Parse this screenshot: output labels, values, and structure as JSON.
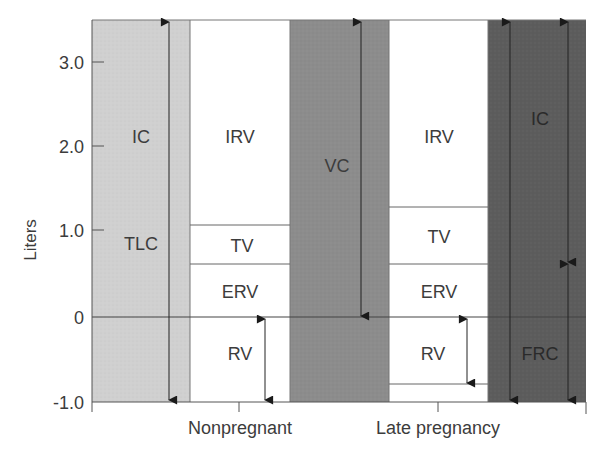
{
  "y_axis": {
    "label": "Liters",
    "ticks": [
      {
        "value": 3.0,
        "label": "3.0"
      },
      {
        "value": 2.0,
        "label": "2.0"
      },
      {
        "value": 1.0,
        "label": "1.0"
      },
      {
        "value": 0,
        "label": "0"
      },
      {
        "value": -1.0,
        "label": "-1.0"
      }
    ],
    "range": [
      -1.0,
      3.5
    ]
  },
  "x_axis": {
    "categories": [
      "Nonpregnant",
      "Late pregnancy"
    ]
  },
  "columns": {
    "tlc": {
      "labels": [
        "IC",
        "TLC"
      ],
      "color": "#cfcfcf"
    },
    "nonpregnant": {
      "segments": [
        {
          "name": "IRV",
          "top": 3.5,
          "bottom": 1.08
        },
        {
          "name": "TV",
          "top": 1.08,
          "bottom": 0.62
        },
        {
          "name": "ERV",
          "top": 0.62,
          "bottom": 0
        },
        {
          "name": "RV",
          "top": 0,
          "bottom": -1.0
        }
      ],
      "color": "#ffffff"
    },
    "vc": {
      "labels": [
        "VC"
      ],
      "color": "#8e8e8e"
    },
    "late_pregnancy": {
      "segments": [
        {
          "name": "IRV",
          "top": 3.5,
          "bottom": 1.28
        },
        {
          "name": "TV",
          "top": 1.28,
          "bottom": 0.62
        },
        {
          "name": "ERV",
          "top": 0.62,
          "bottom": 0
        },
        {
          "name": "RV",
          "top": 0,
          "bottom": -0.8
        }
      ],
      "color": "#ffffff"
    },
    "right": {
      "labels": [
        "IC",
        "FRC"
      ],
      "color": "#5e5e5e",
      "ic_frc_boundary": 0.64
    }
  },
  "labels": {
    "tlc_ic": "IC",
    "tlc": "TLC",
    "np_irv": "IRV",
    "np_tv": "TV",
    "np_erv": "ERV",
    "np_rv": "RV",
    "vc": "VC",
    "lp_irv": "IRV",
    "lp_tv": "TV",
    "lp_erv": "ERV",
    "lp_rv": "RV",
    "r_ic": "IC",
    "r_frc": "FRC"
  }
}
